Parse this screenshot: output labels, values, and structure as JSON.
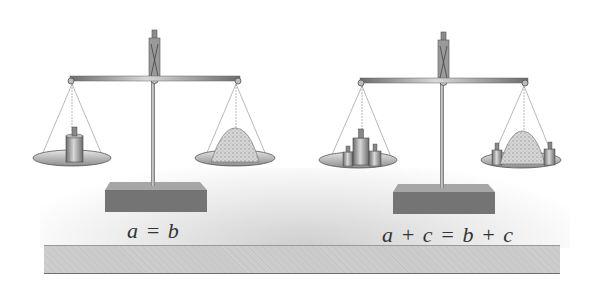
{
  "figure": {
    "colors": {
      "metal": "#8a8a8a",
      "base_top": "#9c9c9c",
      "base_front": "#707070",
      "sand": "#cfcfcf",
      "table_front": "#c8c8c8",
      "text": "#333333"
    },
    "scales": [
      {
        "id": "left",
        "caption": "a = b",
        "left_pan": "single-weight",
        "right_pan": "sand-pile"
      },
      {
        "id": "right",
        "caption": "a + c = b + c",
        "left_pan": "weight-plus-two-small-weights",
        "right_pan": "sand-pile-plus-two-small-weights"
      }
    ]
  }
}
